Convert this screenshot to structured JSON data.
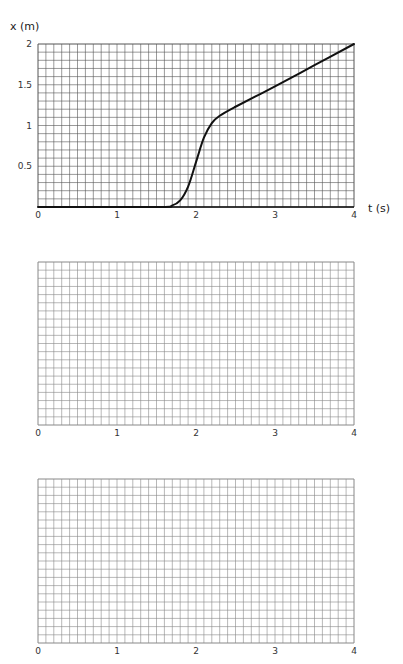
{
  "chart_data": [
    {
      "type": "line",
      "title": "",
      "xlabel": "t (s)",
      "ylabel": "x (m)",
      "xlim": [
        0,
        4
      ],
      "ylim": [
        0,
        2
      ],
      "x_ticks": [
        "0",
        "1",
        "2",
        "3",
        "4"
      ],
      "y_ticks": [
        "0.5",
        "1",
        "1.5",
        "2"
      ],
      "grid": true,
      "grid_minor_x": 0.1,
      "grid_minor_y": 0.1,
      "series": [
        {
          "name": "x(t)",
          "x": [
            0,
            1.5,
            1.7,
            1.8,
            1.9,
            2.0,
            2.1,
            2.2,
            2.3,
            2.5,
            3.0,
            3.5,
            4.0
          ],
          "y": [
            0,
            0,
            0.02,
            0.08,
            0.25,
            0.55,
            0.85,
            1.03,
            1.12,
            1.23,
            1.48,
            1.74,
            2.0
          ]
        }
      ]
    },
    {
      "type": "line",
      "title": "",
      "xlabel": "",
      "ylabel": "",
      "xlim": [
        0,
        4
      ],
      "x_ticks": [
        "0",
        "1",
        "2",
        "3",
        "4"
      ],
      "y_ticks": [],
      "grid": true,
      "series": []
    },
    {
      "type": "line",
      "title": "",
      "xlabel": "",
      "ylabel": "",
      "xlim": [
        0,
        4
      ],
      "x_ticks": [
        "0",
        "1",
        "2",
        "3",
        "4"
      ],
      "y_ticks": [],
      "grid": true,
      "series": []
    }
  ],
  "labels": {
    "top_ylabel": "x (m)",
    "top_xlabel": "t (s)"
  },
  "colors": {
    "grid_line": "#555555",
    "grid_line_light": "#888888",
    "curve": "#111111"
  }
}
